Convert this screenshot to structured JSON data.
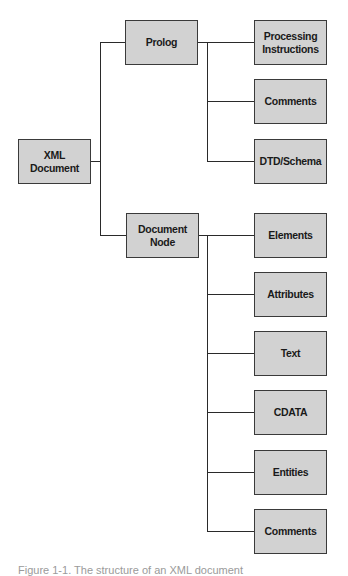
{
  "diagram": {
    "type": "tree",
    "root": {
      "label": "XML Document"
    },
    "branches": [
      {
        "label": "Prolog",
        "children": [
          {
            "label": "Processing Instructions"
          },
          {
            "label": "Comments"
          },
          {
            "label": "DTD/Schema"
          }
        ]
      },
      {
        "label": "Document Node",
        "children": [
          {
            "label": "Elements"
          },
          {
            "label": "Attributes"
          },
          {
            "label": "Text"
          },
          {
            "label": "CDATA"
          },
          {
            "label": "Entities"
          },
          {
            "label": "Comments"
          }
        ]
      }
    ],
    "caption": "Figure 1-1. The structure of an XML document"
  },
  "colors": {
    "node_fill": "#d2d2d2",
    "node_border": "#3a3a3a",
    "connector": "#2a2a2a",
    "text": "#1a1a1a"
  }
}
